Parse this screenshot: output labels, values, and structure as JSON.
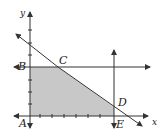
{
  "diagram": {
    "axes": {
      "x_label": "x",
      "y_label": "y"
    },
    "points": {
      "A": "A",
      "B": "B",
      "C": "C",
      "D": "D",
      "E": "E"
    },
    "colors": {
      "region": "#c8c8c8",
      "line": "#333333"
    }
  }
}
